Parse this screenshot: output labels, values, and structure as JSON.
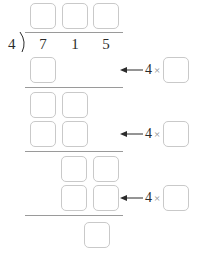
{
  "problem": {
    "type": "long-division",
    "divisor": "4",
    "dividend_digits": [
      "7",
      "1",
      "5"
    ],
    "dividend": "715",
    "bracket_glyph": ")"
  },
  "quotient_boxes": [
    {
      "label": ""
    },
    {
      "label": ""
    },
    {
      "label": ""
    }
  ],
  "work_boxes": {
    "step1_product": [
      {
        "label": ""
      }
    ],
    "step2_bringdown": [
      {
        "label": ""
      },
      {
        "label": ""
      }
    ],
    "step2_product": [
      {
        "label": ""
      },
      {
        "label": ""
      }
    ],
    "step3_bringdown": [
      {
        "label": ""
      },
      {
        "label": ""
      }
    ],
    "step3_product": [
      {
        "label": ""
      },
      {
        "label": ""
      }
    ],
    "remainder": [
      {
        "label": ""
      }
    ]
  },
  "annotations": [
    {
      "arrow": "left-arrow-icon",
      "multiplier": "4",
      "times": "×",
      "factor_box": ""
    },
    {
      "arrow": "left-arrow-icon",
      "multiplier": "4",
      "times": "×",
      "factor_box": ""
    },
    {
      "arrow": "left-arrow-icon",
      "multiplier": "4",
      "times": "×",
      "factor_box": ""
    }
  ],
  "rules": [
    {
      "name": "division-bar"
    },
    {
      "name": "subtraction-line-1"
    },
    {
      "name": "subtraction-line-2"
    },
    {
      "name": "subtraction-line-3"
    }
  ],
  "colors": {
    "box_border": "#c9c9c9",
    "rule": "#9a9a9a",
    "text": "#2b2b2b",
    "times_symbol": "#8a8a8a",
    "background": "#ffffff"
  }
}
